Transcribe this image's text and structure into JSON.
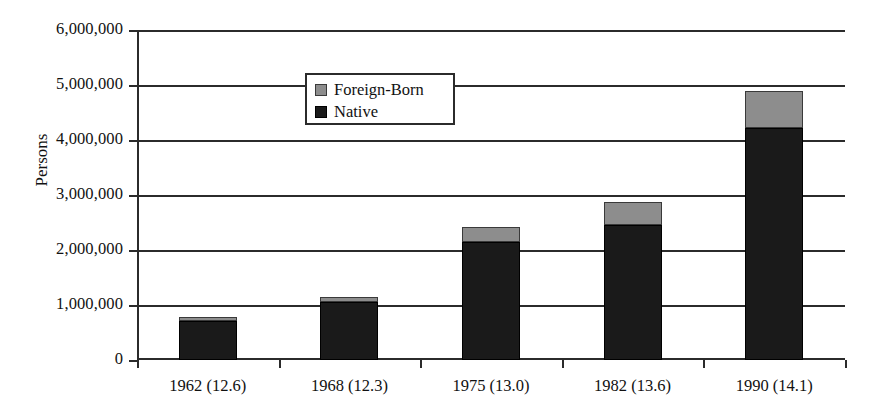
{
  "chart_data": {
    "type": "bar",
    "subtype": "stacked-vertical",
    "title": "",
    "xlabel": "",
    "ylabel": "Persons",
    "categories": [
      "1962 (12.6)",
      "1968 (12.3)",
      "1975 (13.0)",
      "1982 (13.6)",
      "1990 (14.1)"
    ],
    "series": [
      {
        "name": "Native",
        "color": "#1a1a1a",
        "values": [
          710000,
          1060000,
          2140000,
          2450000,
          4220000
        ]
      },
      {
        "name": "Foreign-Born",
        "color": "#8d8d8d",
        "values": [
          70000,
          80000,
          280000,
          420000,
          680000
        ]
      }
    ],
    "totals": [
      780000,
      1140000,
      2420000,
      2870000,
      4900000
    ],
    "stack_order_bottom_to_top": [
      "Native",
      "Foreign-Born"
    ],
    "ylim": [
      0,
      6000000
    ],
    "ytick_step": 1000000,
    "ytick_labels": [
      "6,000,000",
      "5,000,000",
      "4,000,000",
      "3,000,000",
      "2,000,000",
      "1,000,000",
      "0"
    ],
    "ytick_values": [
      6000000,
      5000000,
      4000000,
      3000000,
      2000000,
      1000000,
      0
    ],
    "grid": {
      "horizontal": true,
      "vertical": false
    },
    "legend": {
      "position": "top-left-inside",
      "entries": [
        {
          "label": "Foreign-Born",
          "color": "#8d8d8d",
          "icon": "square-swatch-gray"
        },
        {
          "label": "Native",
          "color": "#1a1a1a",
          "icon": "square-swatch-black"
        }
      ]
    },
    "axis_color": "#2b2b2b",
    "background": "#ffffff"
  }
}
